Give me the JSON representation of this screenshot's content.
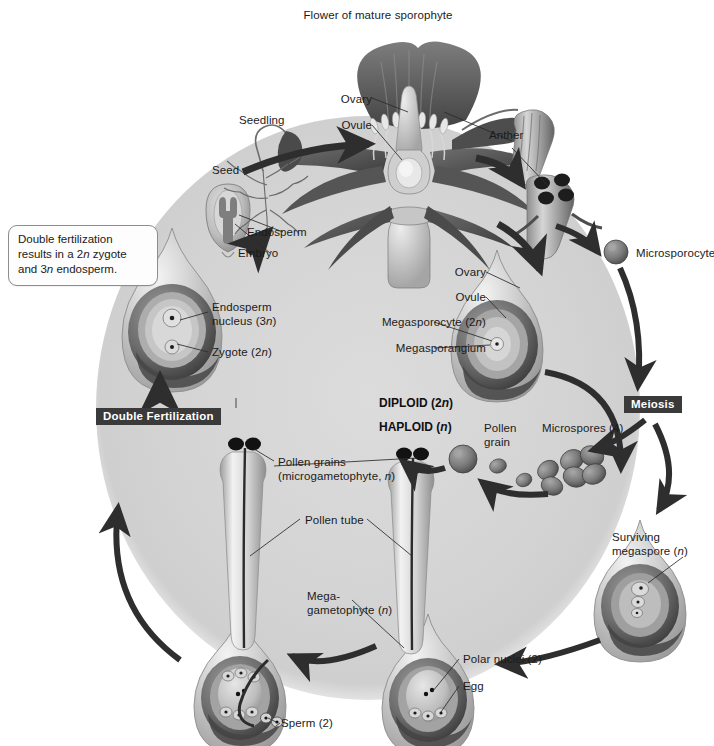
{
  "figure": {
    "title": "Flower of mature sporophyte",
    "domain": "angiosperm-life-cycle-diagram"
  },
  "callouts": [
    {
      "id": "double-fertilization-note",
      "text": "Double fertilization\nresults in a 2n zygote\nand 3n endosperm."
    }
  ],
  "process_bars": [
    {
      "id": "double-fertilization",
      "label": "Double Fertilization"
    },
    {
      "id": "meiosis",
      "label": "Meiosis"
    }
  ],
  "ploidy_labels": [
    {
      "id": "diploid",
      "text": "DIPLOID (2n)"
    },
    {
      "id": "haploid",
      "text": "HAPLOID (n)"
    }
  ],
  "labels": [
    {
      "id": "flower-of-mature-sporophyte",
      "text": "Flower of mature sporophyte"
    },
    {
      "id": "ovary-flower",
      "text": "Ovary"
    },
    {
      "id": "ovule-flower",
      "text": "Ovule"
    },
    {
      "id": "anther",
      "text": "Anther"
    },
    {
      "id": "microsporocyte",
      "text": "Microsporocyte"
    },
    {
      "id": "seedling",
      "text": "Seedling"
    },
    {
      "id": "seed",
      "text": "Seed"
    },
    {
      "id": "endosperm",
      "text": "Endosperm"
    },
    {
      "id": "embryo",
      "text": "Embryo"
    },
    {
      "id": "endosperm-nucleus",
      "text": "Endosperm\nnucleus (3n)"
    },
    {
      "id": "zygote",
      "text": "Zygote (2n)"
    },
    {
      "id": "ovary-ovule-stage",
      "text": "Ovary"
    },
    {
      "id": "ovule-stage",
      "text": "Ovule"
    },
    {
      "id": "megasporocyte",
      "text": "Megasporocyte (2n)"
    },
    {
      "id": "megasporangium",
      "text": "Megasporangium"
    },
    {
      "id": "microspores",
      "text": "Microspores (4)"
    },
    {
      "id": "pollen-grain",
      "text": "Pollen\ngrain"
    },
    {
      "id": "pollen-grains-microgametophyte",
      "text": "Pollen grains\n(microgametophyte, n)"
    },
    {
      "id": "pollen-tube",
      "text": "Pollen tube"
    },
    {
      "id": "surviving-megaspore",
      "text": "Surviving\nmegaspore (n)"
    },
    {
      "id": "megagametophyte",
      "text": "Mega-\ngametophyte (n)"
    },
    {
      "id": "sperm",
      "text": "Sperm (2)"
    },
    {
      "id": "polar-nuclei",
      "text": "Polar nuclei (2)"
    },
    {
      "id": "egg",
      "text": "Egg"
    }
  ],
  "colors": {
    "background": "#ffffff",
    "cycle_field": "#d3d3d3",
    "ink": "#1b1b1b",
    "bar_fill": "#3a3a3a",
    "bar_text": "#ffffff",
    "arrow": "#2e2e2e",
    "structure_dark": "#585858",
    "structure_mid": "#8e8e8e",
    "structure_light": "#c9c9c9",
    "callout_border": "#8d8d8d"
  },
  "chart_data": {
    "type": "diagram",
    "cycle_direction": "clockwise",
    "stages": [
      {
        "order": 1,
        "name": "Flower of mature sporophyte",
        "ploidy": "2n",
        "parts": [
          "Ovary",
          "Ovule",
          "Anther"
        ]
      },
      {
        "order": 2,
        "name": "Anther cross section",
        "ploidy": "2n",
        "parts": [
          "Microsporocyte"
        ]
      },
      {
        "order": 3,
        "name": "Ovule with megasporangium",
        "ploidy": "2n",
        "parts": [
          "Ovary",
          "Ovule",
          "Megasporocyte (2n)",
          "Megasporangium"
        ]
      },
      {
        "order": 4,
        "name": "Meiosis",
        "ploidy": "2n to n"
      },
      {
        "order": 5,
        "name": "Microspores (4)",
        "ploidy": "n",
        "count": 4
      },
      {
        "order": 6,
        "name": "Pollen grain",
        "ploidy": "n"
      },
      {
        "order": 7,
        "name": "Surviving megaspore (n)",
        "ploidy": "n",
        "count": 1
      },
      {
        "order": 8,
        "name": "Megagametophyte (n)",
        "ploidy": "n",
        "parts": [
          "Polar nuclei (2)",
          "Egg"
        ]
      },
      {
        "order": 9,
        "name": "Pollen tube with pollen grains (microgametophyte, n)",
        "ploidy": "n",
        "parts": [
          "Sperm (2)",
          "Pollen tube"
        ]
      },
      {
        "order": 10,
        "name": "Double Fertilization",
        "ploidy": "n to 2n/3n"
      },
      {
        "order": 11,
        "name": "Ovule after fertilization",
        "ploidy": "2n",
        "parts": [
          "Endosperm nucleus (3n)",
          "Zygote (2n)"
        ]
      },
      {
        "order": 12,
        "name": "Seed",
        "ploidy": "2n",
        "parts": [
          "Endosperm",
          "Embryo"
        ]
      },
      {
        "order": 13,
        "name": "Seedling",
        "ploidy": "2n"
      }
    ],
    "counts": {
      "microspores": 4,
      "sperm": 2,
      "polar_nuclei": 2,
      "eggs": 1,
      "surviving_megaspores": 1
    },
    "ploidy_key": [
      "DIPLOID (2n)",
      "HAPLOID (n)"
    ]
  }
}
